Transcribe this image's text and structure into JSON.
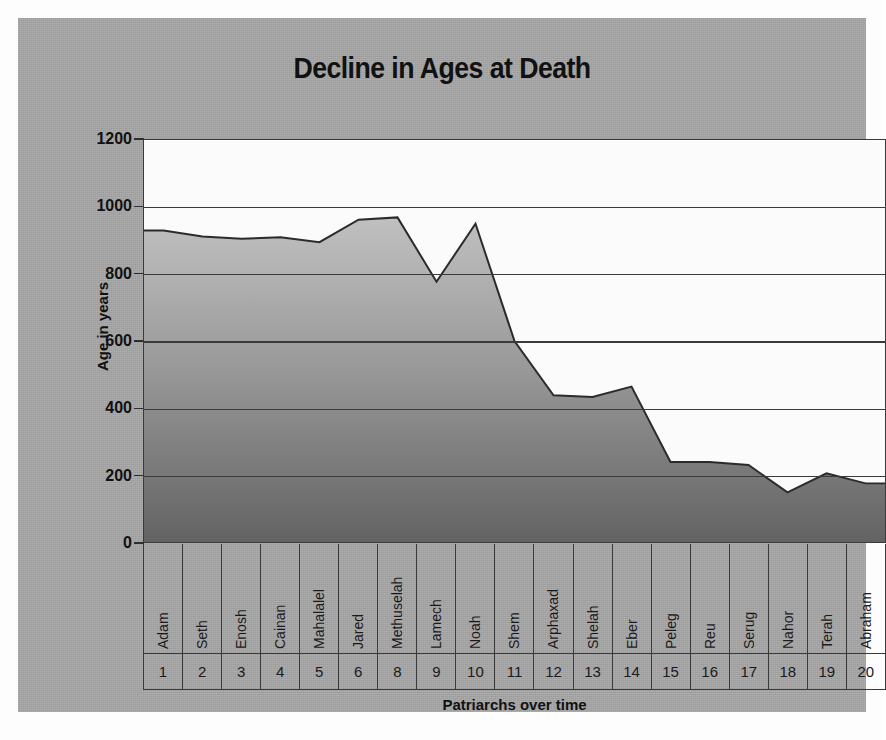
{
  "chart_data": {
    "type": "area",
    "title": "Decline in Ages at Death",
    "xlabel": "Patriarchs over time",
    "ylabel": "Age in years",
    "ylim": [
      0,
      1200
    ],
    "ytick_labels": [
      "1200",
      "1000",
      "800",
      "600",
      "400",
      "200",
      "0"
    ],
    "ytick_values": [
      1200,
      1000,
      800,
      600,
      400,
      200,
      0
    ],
    "grid": true,
    "legend": "none",
    "categories": [
      "Adam",
      "Seth",
      "Enosh",
      "Cainan",
      "Mahalalel",
      "Jared",
      "Methuselah",
      "Lamech",
      "Noah",
      "Shem",
      "Arphaxad",
      "Shelah",
      "Eber",
      "Peleg",
      "Reu",
      "Serug",
      "Nahor",
      "Terah",
      "Abraham"
    ],
    "category_numbers": [
      "1",
      "2",
      "3",
      "4",
      "5",
      "6",
      "8",
      "9",
      "10",
      "11",
      "12",
      "13",
      "14",
      "15",
      "16",
      "17",
      "18",
      "19",
      "20"
    ],
    "values": [
      930,
      912,
      905,
      910,
      895,
      962,
      969,
      777,
      950,
      600,
      438,
      433,
      464,
      239,
      239,
      230,
      148,
      205,
      175
    ],
    "series": [
      {
        "name": "Age at death",
        "values": [
          930,
          912,
          905,
          910,
          895,
          962,
          969,
          777,
          950,
          600,
          438,
          433,
          464,
          239,
          239,
          230,
          148,
          205,
          175
        ]
      }
    ]
  },
  "colors": {
    "plate_background": "#a6a6a6",
    "plot_background": "#fbfbfb",
    "axis_line": "#3a3a3a",
    "area_fill_top": "#b9b9b9",
    "area_fill_bottom": "#6d6d6d",
    "area_stroke": "#2b2b2b",
    "text": "#111111"
  }
}
